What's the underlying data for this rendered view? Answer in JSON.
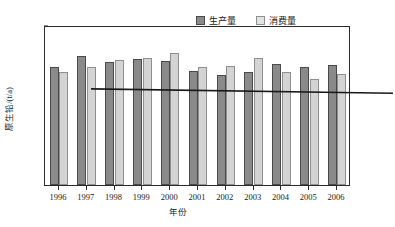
{
  "chart_data": {
    "type": "bar",
    "title": "",
    "xlabel": "年份",
    "ylabel": "原生铅/(t/a)",
    "ylim": [
      0,
      25000
    ],
    "yticks": [
      25000,
      20000,
      15000,
      10000,
      5000
    ],
    "ytick_labels": [
      "25000",
      "20000",
      "15000",
      "10000",
      "5000"
    ],
    "grid": false,
    "legend_position": "top-right",
    "categories": [
      "1996",
      "1997",
      "1998",
      "1999",
      "2000",
      "2001",
      "2002",
      "2003",
      "2004",
      "2005",
      "2006"
    ],
    "series": [
      {
        "name": "生产量",
        "color": "#8a8a8a",
        "values": [
          18500,
          20100,
          19200,
          19700,
          19300,
          17800,
          17200,
          17600,
          18900,
          18400,
          18700
        ]
      },
      {
        "name": "消费量",
        "color": "#d4d4d4",
        "values": [
          17700,
          18400,
          19600,
          19800,
          20700,
          18400,
          18600,
          19900,
          17600,
          16600,
          17300
        ]
      }
    ],
    "trend_line": {
      "name": "trend",
      "color": "#1a1a1a",
      "start_value": 19400,
      "end_value": 18700
    }
  },
  "legend": {
    "items": [
      {
        "label": "生产量",
        "swatch": "filled-dark-square-icon"
      },
      {
        "label": "消费量",
        "swatch": "filled-light-square-icon"
      }
    ]
  },
  "axes": {
    "y_title": "原生铅/(t/a)",
    "x_title": "年份"
  }
}
